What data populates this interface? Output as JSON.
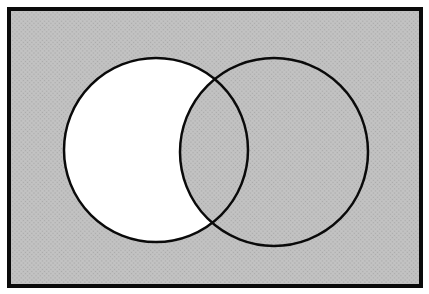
{
  "figure": {
    "type": "venn-diagram",
    "set_count": 2,
    "labels": [],
    "regions": [
      {
        "region": "left-circle-only",
        "shaded": false
      },
      {
        "region": "intersection",
        "shaded": true
      },
      {
        "region": "right-circle-only",
        "shaded": true
      },
      {
        "region": "universe-outside-circles",
        "shaded": true
      }
    ]
  },
  "colors": {
    "page_background": "#ffffff",
    "shaded_fill": "#c3c3c3",
    "shade_texture_dot": "#a9a9a9",
    "unshaded_fill": "#ffffff",
    "outline": "#0a0a0a"
  }
}
